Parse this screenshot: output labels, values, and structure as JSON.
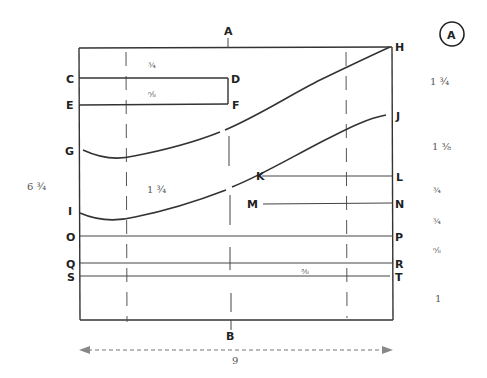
{
  "figure": {
    "badge": "A",
    "overall_height": "6 ¾",
    "overall_width": "9"
  },
  "points": {
    "A": "A",
    "B": "B",
    "C": "C",
    "D": "D",
    "E": "E",
    "F": "F",
    "G": "G",
    "H": "H",
    "I": "I",
    "J": "J",
    "K": "K",
    "L": "L",
    "M": "M",
    "N": "N",
    "O": "O",
    "P": "P",
    "Q": "Q",
    "R": "R",
    "S": "S",
    "T": "T"
  },
  "inner_measurements": {
    "top_to_CD": "¾",
    "CD_to_EF": "⅝",
    "G_to_I": "1 ¾",
    "Q_to_S": "⅜"
  },
  "right_measurements": [
    {
      "id": "H_to_J",
      "value": "1 ¾"
    },
    {
      "id": "J_to_L",
      "value": "1 ⅜"
    },
    {
      "id": "L_to_N",
      "value": "¾"
    },
    {
      "id": "N_to_P",
      "value": "¾"
    },
    {
      "id": "P_to_R",
      "value": "⅝"
    },
    {
      "id": "T_to_bottom",
      "value": "1"
    }
  ]
}
